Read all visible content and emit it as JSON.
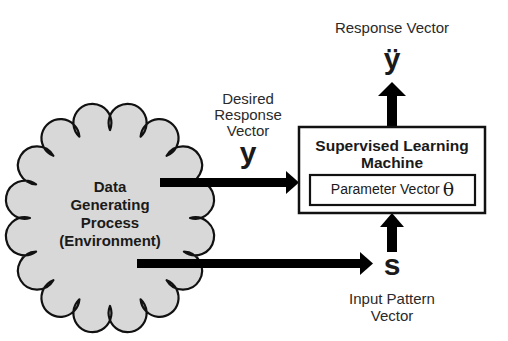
{
  "top_label": "Response Vector",
  "top_symbol": "ÿ",
  "desired": {
    "lines": [
      "Desired",
      "Response",
      "Vector"
    ],
    "symbol": "y"
  },
  "machine": {
    "title_lines": [
      "Supervised Learning",
      "Machine"
    ],
    "param_label": "Parameter Vector",
    "param_symbol": "θ"
  },
  "environment": {
    "lines": [
      "Data",
      "Generating",
      "Process",
      "(Environment)"
    ]
  },
  "input": {
    "symbol": "s",
    "lines": [
      "Input Pattern",
      "Vector"
    ]
  },
  "colors": {
    "cloud_fill": "#d8d8d8",
    "stroke": "#111111"
  }
}
